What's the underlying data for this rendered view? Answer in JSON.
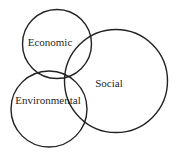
{
  "diagram": {
    "type": "venn",
    "background_color": "#ffffff",
    "line_color": "#222222",
    "text_color": "#1f1f1f",
    "circles": [
      {
        "label": "Economic"
      },
      {
        "label": "Environmental"
      },
      {
        "label": "Social"
      }
    ]
  }
}
